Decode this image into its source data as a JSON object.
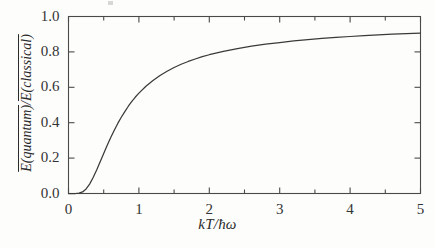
{
  "figure": {
    "background_color": "#fdfdfc",
    "frame_color": "#4a4a4a",
    "curve_color": "#3a3a3a"
  },
  "axes": {
    "x_label": "kT/ħω",
    "y_label_numerator": "E(quantum)",
    "y_label_denominator": "E(classical)",
    "y_label": "E(quantum)/E(classical)",
    "x_ticks": [
      "0",
      "1",
      "2",
      "3",
      "4",
      "5"
    ],
    "y_ticks": [
      "0.0",
      "0.2",
      "0.4",
      "0.6",
      "0.8",
      "1.0"
    ]
  },
  "chart_data": {
    "type": "line",
    "title": "",
    "subtitle": "",
    "xlabel": "kT/ħω",
    "ylabel": "Ē(quantum)/Ē(classical)",
    "xlim": [
      0,
      5
    ],
    "ylim": [
      0,
      1
    ],
    "xticks": [
      0,
      1,
      2,
      3,
      4,
      5
    ],
    "yticks": [
      0.0,
      0.2,
      0.4,
      0.6,
      0.8,
      1.0
    ],
    "x_minor_tick_step": 0.5,
    "y_minor_ticks": [],
    "grid": false,
    "legend": null,
    "annotations": [],
    "series": [
      {
        "name": "Einstein mean energy ratio",
        "formula": "y = x / (exp(1/x) - 1), x = kT/hbar*omega",
        "x": [
          0.0,
          0.05,
          0.1,
          0.15,
          0.2,
          0.25,
          0.3,
          0.35,
          0.4,
          0.45,
          0.5,
          0.55,
          0.6,
          0.65,
          0.7,
          0.75,
          0.8,
          0.85,
          0.9,
          0.95,
          1.0,
          1.1,
          1.2,
          1.3,
          1.4,
          1.5,
          1.6,
          1.7,
          1.8,
          1.9,
          2.0,
          2.2,
          2.4,
          2.6,
          2.8,
          3.0,
          3.2,
          3.4,
          3.6,
          3.8,
          4.0,
          4.2,
          4.4,
          4.6,
          4.8,
          5.0
        ],
        "y": [
          0.0,
          0.0,
          0.0,
          0.002,
          0.009,
          0.026,
          0.053,
          0.09,
          0.133,
          0.179,
          0.226,
          0.272,
          0.316,
          0.357,
          0.396,
          0.431,
          0.463,
          0.493,
          0.52,
          0.545,
          0.567,
          0.606,
          0.639,
          0.667,
          0.691,
          0.712,
          0.73,
          0.746,
          0.76,
          0.773,
          0.784,
          0.803,
          0.819,
          0.832,
          0.844,
          0.853,
          0.862,
          0.869,
          0.876,
          0.882,
          0.887,
          0.892,
          0.896,
          0.9,
          0.903,
          0.906
        ]
      }
    ]
  }
}
